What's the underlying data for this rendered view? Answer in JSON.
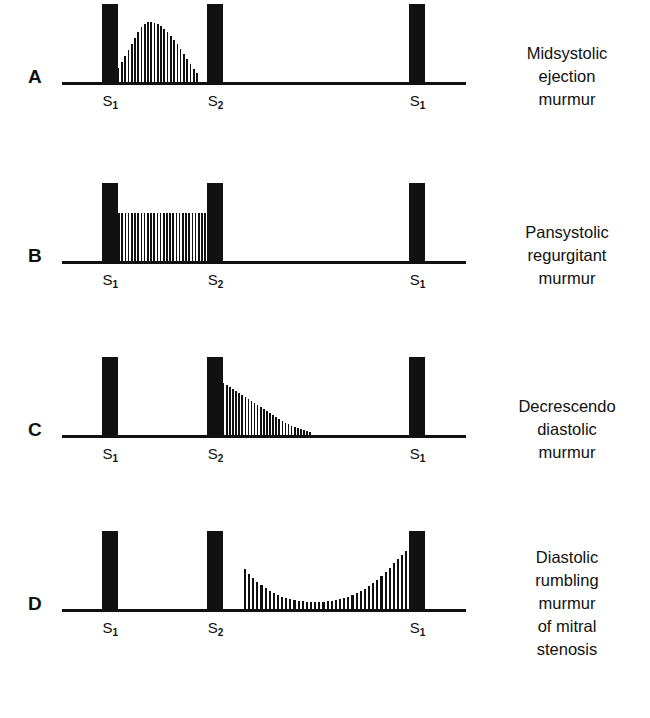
{
  "figure": {
    "type": "diagram",
    "sound_label_s1": "S",
    "sound_label_s1_sub": "1",
    "sound_label_s2": "S",
    "sound_label_s2_sub": "2"
  },
  "chart_data": {
    "type": "line",
    "xlabel": "",
    "ylabel": "",
    "grid": false,
    "legend": "none",
    "panels": [
      {
        "letter": "A",
        "caption_lines": [
          "Midsystolic",
          "ejection",
          "murmur"
        ],
        "shape": "diamond",
        "phase": "systolic",
        "heart_sounds": [
          "S1",
          "S2",
          "S1"
        ],
        "murmur_start_pct": 13,
        "murmur_end_pct": 34,
        "peak_pct": 23,
        "max_height": 60,
        "bar_count": 26,
        "envelope": [
          8,
          14,
          20,
          26,
          32,
          38,
          44,
          50,
          55,
          58,
          60,
          60,
          59,
          58,
          56,
          53,
          50,
          46,
          42,
          38,
          33,
          28,
          23,
          18,
          13,
          9
        ]
      },
      {
        "letter": "B",
        "caption_lines": [
          "Pansystolic",
          "regurgitant",
          "murmur"
        ],
        "shape": "plateau",
        "phase": "systolic",
        "heart_sounds": [
          "S1",
          "S2",
          "S1"
        ],
        "murmur_start_pct": 10,
        "murmur_end_pct": 36,
        "peak_pct": 23,
        "max_height": 48,
        "bar_count": 33,
        "envelope": [
          48,
          48,
          48,
          48,
          48,
          48,
          48,
          48,
          48,
          48,
          48,
          48,
          48,
          48,
          48,
          48,
          48,
          48,
          48,
          48,
          48,
          48,
          48,
          48,
          48,
          48,
          48,
          48,
          48,
          48,
          48,
          48,
          48
        ]
      },
      {
        "letter": "C",
        "caption_lines": [
          "Decrescendo",
          "diastolic",
          "murmur"
        ],
        "shape": "decrescendo",
        "phase": "diastolic",
        "heart_sounds": [
          "S1",
          "S2",
          "S1"
        ],
        "murmur_start_pct": 36,
        "murmur_end_pct": 62,
        "peak_pct": 36,
        "max_height": 62,
        "bar_count": 34,
        "envelope": [
          62,
          60,
          58,
          56,
          54,
          52,
          50,
          48,
          46,
          44,
          42,
          40,
          38,
          36,
          34,
          32,
          30,
          28,
          26,
          24,
          22,
          20,
          18,
          16,
          14,
          12,
          11,
          9,
          8,
          7,
          6,
          5,
          4,
          3
        ]
      },
      {
        "letter": "D",
        "caption_lines": [
          "Diastolic",
          "rumbling",
          "murmur",
          "of mitral",
          "stenosis"
        ],
        "shape": "u-curve",
        "phase": "diastolic",
        "heart_sounds": [
          "S1",
          "S2",
          "S1"
        ],
        "murmur_start_pct": 45,
        "murmur_end_pct": 86,
        "peak_pct": 86,
        "max_height": 58,
        "bar_count": 40,
        "envelope": [
          40,
          35,
          31,
          27,
          24,
          21,
          18,
          16,
          14,
          12,
          11,
          10,
          9,
          8,
          8,
          7,
          7,
          7,
          7,
          7,
          8,
          8,
          9,
          10,
          11,
          12,
          14,
          16,
          18,
          20,
          23,
          26,
          29,
          33,
          37,
          41,
          46,
          50,
          54,
          58
        ]
      }
    ],
    "sound_markers": [
      {
        "name": "S1",
        "x_pct": 10,
        "height": 78
      },
      {
        "name": "S2",
        "x_pct": 36,
        "height": 78
      },
      {
        "name": "S1",
        "x_pct": 86,
        "height": 78
      }
    ]
  },
  "colors": {
    "ink": "#111111",
    "background": "#ffffff"
  }
}
